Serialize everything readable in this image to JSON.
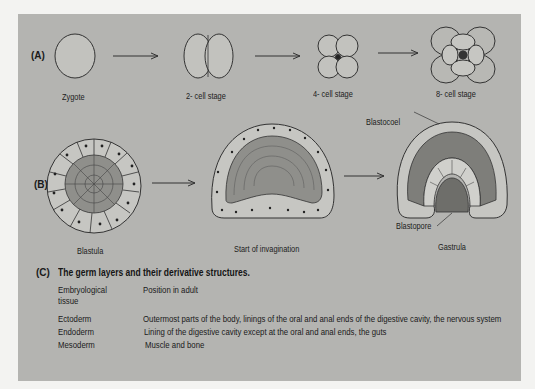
{
  "figure": {
    "section_a": {
      "label": "(A)",
      "stages": [
        {
          "name": "Zygote"
        },
        {
          "name": "2- cell stage"
        },
        {
          "name": "4- cell stage"
        },
        {
          "name": "8- cell stage"
        }
      ]
    },
    "section_b": {
      "label": "(B)",
      "stages": [
        {
          "name": "Blastula"
        },
        {
          "name": "Start of invagination"
        },
        {
          "name": "Gastrula"
        }
      ],
      "annotations": {
        "blastocoel": "Blastocoel",
        "blastopore": "Blastopore"
      }
    },
    "section_c": {
      "label": "(C)",
      "title": "The germ layers and their derivative structures.",
      "headers": {
        "tissue_line1": "Embryological",
        "tissue_line2": "tissue",
        "position": "Position in adult"
      },
      "rows": [
        {
          "tissue": "Ectoderm",
          "position": "Outermost parts of the body, linings of the oral and anal ends of the digestive cavity, the nervous system"
        },
        {
          "tissue": "Endoderm",
          "position": "Lining of the digestive cavity except at the oral and anal ends, the guts"
        },
        {
          "tissue": "Mesoderm",
          "position": "Muscle and bone"
        }
      ]
    },
    "colors": {
      "page_bg": "#f3f3f1",
      "panel_bg": "#b4b4b1",
      "cell_fill": "#c6c6c2",
      "inner_cell_fill": "#8f8f8b",
      "outline": "#333333"
    }
  }
}
